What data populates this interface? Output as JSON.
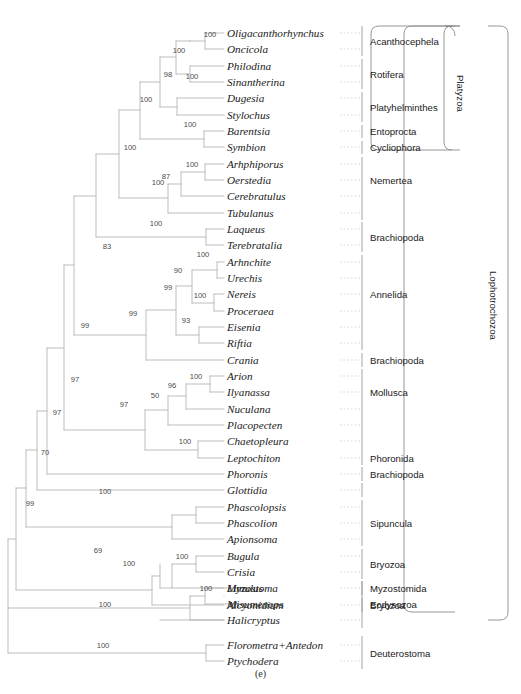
{
  "figure": {
    "caption": "(e)",
    "type": "phylogenetic-cladogram",
    "colors": {
      "branch": "#b0b0b0",
      "text": "#1a1a1a",
      "support": "#4a4a4a",
      "bracket": "#888888",
      "background": "#ffffff"
    }
  },
  "taxa": [
    {
      "name": "Oligacanthorhynchus",
      "y": 33
    },
    {
      "name": "Oncicola",
      "y": 49
    },
    {
      "name": "Philodina",
      "y": 66
    },
    {
      "name": "Sinantherina",
      "y": 82
    },
    {
      "name": "Dugesia",
      "y": 98
    },
    {
      "name": "Stylochus",
      "y": 115
    },
    {
      "name": "Barentsia",
      "y": 131
    },
    {
      "name": "Symbion",
      "y": 147
    },
    {
      "name": "Arhphiporus",
      "y": 164
    },
    {
      "name": "Oerstedia",
      "y": 180
    },
    {
      "name": "Cerebratulus",
      "y": 196
    },
    {
      "name": "Tubulanus",
      "y": 213
    },
    {
      "name": "Laqueus",
      "y": 229
    },
    {
      "name": "Terebratalia",
      "y": 245
    },
    {
      "name": "Arhnchite",
      "y": 262
    },
    {
      "name": "Urechis",
      "y": 278
    },
    {
      "name": "Nereis",
      "y": 294
    },
    {
      "name": "Proceraea",
      "y": 311
    },
    {
      "name": "Eisenia",
      "y": 327
    },
    {
      "name": "Riftia",
      "y": 343
    },
    {
      "name": "Crania",
      "y": 360
    },
    {
      "name": "Arion",
      "y": 376
    },
    {
      "name": "Ilyanassa",
      "y": 392
    },
    {
      "name": "Nuculana",
      "y": 409
    },
    {
      "name": "Placopecten",
      "y": 425
    },
    {
      "name": "Chaetopleura",
      "y": 441
    },
    {
      "name": "Leptochiton",
      "y": 458
    },
    {
      "name": "Phoronis",
      "y": 474
    },
    {
      "name": "Glottidia",
      "y": 490
    },
    {
      "name": "Phascolopsis",
      "y": 507
    },
    {
      "name": "Phascolion",
      "y": 523
    },
    {
      "name": "Apionsoma",
      "y": 539
    },
    {
      "name": "Bugula",
      "y": 556
    },
    {
      "name": "Crisia",
      "y": 572
    },
    {
      "name": "Myzostoma",
      "y": 588
    },
    {
      "name": "Alcyonidium",
      "y": 605
    },
    {
      "name": "Limulus",
      "y": 588
    },
    {
      "name": "Misumenops",
      "y": 604
    },
    {
      "name": "Halicryptus",
      "y": 620
    },
    {
      "name": "Florometra+Antedon",
      "y": 645
    },
    {
      "name": "Ptychodera",
      "y": 661
    }
  ],
  "support_values": [
    {
      "value": "100",
      "x": 210,
      "y": 34
    },
    {
      "value": "100",
      "x": 179,
      "y": 50
    },
    {
      "value": "100",
      "x": 192,
      "y": 76
    },
    {
      "value": "98",
      "x": 168,
      "y": 74
    },
    {
      "value": "100",
      "x": 190,
      "y": 124
    },
    {
      "value": "100",
      "x": 146,
      "y": 99
    },
    {
      "value": "100",
      "x": 192,
      "y": 164
    },
    {
      "value": "87",
      "x": 166,
      "y": 176
    },
    {
      "value": "100",
      "x": 158,
      "y": 182
    },
    {
      "value": "100",
      "x": 130,
      "y": 147
    },
    {
      "value": "100",
      "x": 156,
      "y": 223
    },
    {
      "value": "83",
      "x": 107,
      "y": 246
    },
    {
      "value": "100",
      "x": 203,
      "y": 254
    },
    {
      "value": "90",
      "x": 178,
      "y": 270
    },
    {
      "value": "100",
      "x": 200,
      "y": 295
    },
    {
      "value": "99",
      "x": 168,
      "y": 287
    },
    {
      "value": "93",
      "x": 186,
      "y": 320
    },
    {
      "value": "99",
      "x": 133,
      "y": 313
    },
    {
      "value": "99",
      "x": 85,
      "y": 325
    },
    {
      "value": "100",
      "x": 196,
      "y": 376
    },
    {
      "value": "96",
      "x": 172,
      "y": 385
    },
    {
      "value": "50",
      "x": 155,
      "y": 395
    },
    {
      "value": "100",
      "x": 185,
      "y": 441
    },
    {
      "value": "97",
      "x": 124,
      "y": 404
    },
    {
      "value": "97",
      "x": 75,
      "y": 379
    },
    {
      "value": "97",
      "x": 57,
      "y": 412
    },
    {
      "value": "70",
      "x": 45,
      "y": 452
    },
    {
      "value": "100",
      "x": 105,
      "y": 491
    },
    {
      "value": "100",
      "x": 182,
      "y": 556
    },
    {
      "value": "100",
      "x": 129,
      "y": 563
    },
    {
      "value": "69",
      "x": 98,
      "y": 550
    },
    {
      "value": "99",
      "x": 30,
      "y": 503
    },
    {
      "value": "100",
      "x": 206,
      "y": 588
    },
    {
      "value": "100",
      "x": 105,
      "y": 604
    },
    {
      "value": "100",
      "x": 103,
      "y": 645
    }
  ],
  "group_labels": [
    {
      "label": "Acanthocephela",
      "y": 41
    },
    {
      "label": "Rotifera",
      "y": 74
    },
    {
      "label": "Platyhelminthes",
      "y": 107
    },
    {
      "label": "Entoprocta",
      "y": 131
    },
    {
      "label": "Cycliophora",
      "y": 147
    },
    {
      "label": "Nemertea",
      "y": 180
    },
    {
      "label": "Brachiopoda",
      "y": 237
    },
    {
      "label": "Annelida",
      "y": 294
    },
    {
      "label": "Brachiopoda",
      "y": 360
    },
    {
      "label": "Mollusca",
      "y": 392
    },
    {
      "label": "Phoronida",
      "y": 458
    },
    {
      "label": "Brachiopoda",
      "y": 474
    },
    {
      "label": "Sipuncula",
      "y": 523
    },
    {
      "label": "Bryozoa",
      "y": 564
    },
    {
      "label": "Myzostomida",
      "y": 588
    },
    {
      "label": "Bryozoa",
      "y": 605
    },
    {
      "label": "Ecdysozoa",
      "y": 604
    },
    {
      "label": "Deuterostoma",
      "y": 653
    }
  ],
  "superclade_labels": [
    {
      "label": "Platyzoa",
      "x": 466,
      "y": 75
    },
    {
      "label": "Lophotrochozoa",
      "x": 499,
      "y": 271
    }
  ]
}
